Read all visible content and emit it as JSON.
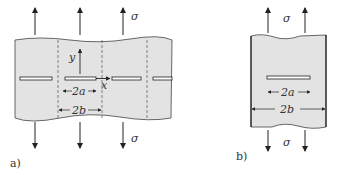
{
  "figure_a": {
    "label": "a)",
    "stress_top": "σ",
    "stress_bottom": "σ",
    "axis_y": "y",
    "axis_x": "x",
    "dim_crack": "2a",
    "dim_period": "2b"
  },
  "figure_b": {
    "label": "b)",
    "stress_top": "σ",
    "stress_bottom": "σ",
    "dim_crack": "2a",
    "dim_width": "2b"
  },
  "colors": {
    "plate_fill": "#e3e3e3",
    "line": "#222222",
    "text": "#333333"
  }
}
